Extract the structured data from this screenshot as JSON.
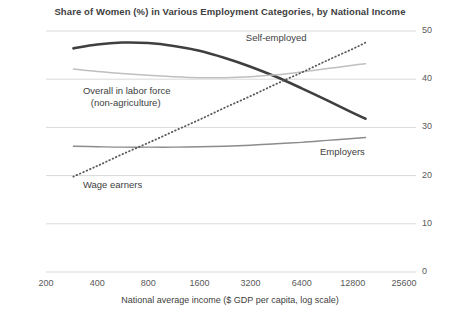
{
  "chart_data": {
    "type": "line",
    "title": "Share of Women (%) in Various Employment Categories, by National Income",
    "xlabel": "National average income ($ GDP per capita, log scale)",
    "ylabel": "",
    "x_scale": "log2",
    "x_tick_labels": [
      "200",
      "400",
      "800",
      "1600",
      "3200",
      "6400",
      "12800",
      "25600"
    ],
    "x_tick_values": [
      200,
      400,
      800,
      1600,
      3200,
      6400,
      12800,
      25600
    ],
    "xlim": [
      200,
      25600
    ],
    "y_tick_labels": [
      "0",
      "10",
      "20",
      "30",
      "40",
      "50"
    ],
    "y_tick_values": [
      0,
      10,
      20,
      30,
      40,
      50
    ],
    "ylim": [
      0,
      50
    ],
    "grid": "horizontal",
    "legend": "inline-annotations",
    "series": [
      {
        "name": "Self-employed",
        "style": "solid-thick",
        "color": "#3f3f3f",
        "label_x": 3000,
        "label_y": 48.5,
        "x": [
          290,
          400,
          560,
          800,
          1130,
          1600,
          2260,
          3200,
          4520,
          6400,
          9050,
          12800,
          15200
        ],
        "y": [
          46.4,
          47.2,
          47.6,
          47.5,
          46.9,
          45.9,
          44.4,
          42.6,
          40.5,
          38.1,
          35.6,
          33.0,
          31.8
        ]
      },
      {
        "name": "Overall in labor force (non-agriculture)",
        "style": "solid-thin",
        "color": "#bfbfbf",
        "label_x": 330,
        "label_y": 37.5,
        "x": [
          290,
          400,
          560,
          800,
          1130,
          1600,
          2260,
          3200,
          4520,
          6400,
          9050,
          12800,
          15200
        ],
        "y": [
          42.1,
          41.6,
          41.2,
          40.8,
          40.5,
          40.3,
          40.3,
          40.5,
          40.9,
          41.5,
          42.2,
          42.9,
          43.2
        ]
      },
      {
        "name": "Employers",
        "style": "solid-medium",
        "color": "#8c8c8c",
        "label_x": 8200,
        "label_y": 25.0,
        "x": [
          290,
          400,
          560,
          800,
          1130,
          1600,
          2260,
          3200,
          4520,
          6400,
          9050,
          12800,
          15200
        ],
        "y": [
          26.1,
          26.0,
          25.9,
          25.9,
          25.9,
          26.0,
          26.1,
          26.3,
          26.6,
          26.9,
          27.3,
          27.7,
          27.9
        ]
      },
      {
        "name": "Wage earners",
        "style": "dotted",
        "color": "#595959",
        "label_x": 330,
        "label_y": 18.0,
        "x": [
          290,
          400,
          560,
          800,
          1130,
          1600,
          2260,
          3200,
          4520,
          6400,
          9050,
          12800,
          15200
        ],
        "y": [
          19.8,
          22.0,
          24.4,
          26.8,
          29.2,
          31.6,
          34.1,
          36.5,
          39.0,
          41.4,
          43.9,
          46.3,
          47.6
        ]
      }
    ]
  },
  "axes": {
    "y_ticks": [
      "0",
      "10",
      "20",
      "30",
      "40",
      "50"
    ],
    "x_ticks": [
      "200",
      "400",
      "800",
      "1600",
      "3200",
      "6400",
      "12800",
      "25600"
    ],
    "x_title": "National average income ($ GDP per capita, log scale)"
  },
  "annotations": {
    "self_employed": "Self-employed",
    "overall_line1": "Overall in labor force",
    "overall_line2": "(non-agriculture)",
    "employers": "Employers",
    "wage_earners": "Wage earners"
  },
  "colors": {
    "self_employed": "#3f3f3f",
    "overall": "#bfbfbf",
    "employers": "#8c8c8c",
    "wage_earners": "#595959",
    "grid": "#d9d9d9",
    "text": "#404040"
  }
}
